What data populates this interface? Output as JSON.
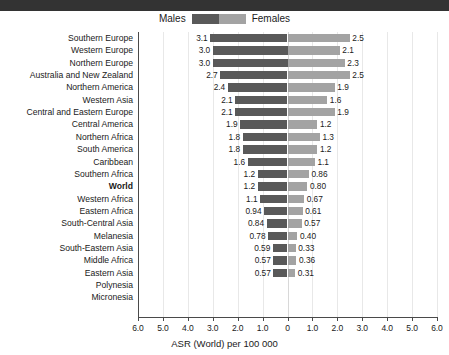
{
  "legend": {
    "males_label": "Males",
    "females_label": "Females",
    "male_color": "#595959",
    "female_color": "#a3a3a3"
  },
  "axis": {
    "title": "ASR (World) per 100 000",
    "ticks": [
      "6.0",
      "5.0",
      "4.0",
      "3.0",
      "2.0",
      "1.0",
      "0",
      "1.0",
      "2.0",
      "3.0",
      "4.0",
      "5.0",
      "6.0"
    ]
  },
  "chart_data": {
    "type": "bar",
    "title": "",
    "subtitle": "",
    "xlabel": "ASR (World) per 100 000",
    "ylabel": "",
    "orientation": "horizontal-diverging",
    "xlim": [
      -6.0,
      6.0
    ],
    "tick_values": [
      -6.0,
      -5.0,
      -4.0,
      -3.0,
      -2.0,
      -1.0,
      0,
      1.0,
      2.0,
      3.0,
      4.0,
      5.0,
      6.0
    ],
    "tick_labels": [
      "6.0",
      "5.0",
      "4.0",
      "3.0",
      "2.0",
      "1.0",
      "0",
      "1.0",
      "2.0",
      "3.0",
      "4.0",
      "5.0",
      "6.0"
    ],
    "grid": true,
    "legend_position": "top-center",
    "legend": [
      "Males",
      "Females"
    ],
    "categories": [
      "Southern Europe",
      "Western Europe",
      "Northern Europe",
      "Australia and New Zealand",
      "Northern America",
      "Western Asia",
      "Central and Eastern Europe",
      "Central America",
      "Northern Africa",
      "South America",
      "Caribbean",
      "Southern Africa",
      "World",
      "Western Africa",
      "Eastern Africa",
      "South-Central Asia",
      "Melanesia",
      "South-Eastern Asia",
      "Middle Africa",
      "Eastern Asia",
      "Polynesia",
      "Micronesia"
    ],
    "series": [
      {
        "name": "Males",
        "values": [
          3.1,
          3.0,
          3.0,
          2.7,
          2.4,
          2.1,
          2.1,
          1.9,
          1.8,
          1.8,
          1.6,
          1.2,
          1.2,
          1.1,
          0.94,
          0.84,
          0.78,
          0.59,
          0.57,
          0.57,
          null,
          null
        ],
        "labels": [
          "3.1",
          "3.0",
          "3.0",
          "2.7",
          "2.4",
          "2.1",
          "2.1",
          "1.9",
          "1.8",
          "1.8",
          "1.6",
          "1.2",
          "1.2",
          "1.1",
          "0.94",
          "0.84",
          "0.78",
          "0.59",
          "0.57",
          "0.57",
          "",
          ""
        ]
      },
      {
        "name": "Females",
        "values": [
          2.5,
          2.1,
          2.3,
          2.5,
          1.9,
          1.6,
          1.9,
          1.2,
          1.3,
          1.2,
          1.1,
          0.86,
          0.8,
          0.67,
          0.61,
          0.57,
          0.4,
          0.33,
          0.36,
          0.31,
          null,
          null
        ],
        "labels": [
          "2.5",
          "2.1",
          "2.3",
          "2.5",
          "1.9",
          "1.6",
          "1.9",
          "1.2",
          "1.3",
          "1.2",
          "1.1",
          "0.86",
          "0.80",
          "0.67",
          "0.61",
          "0.57",
          "0.40",
          "0.33",
          "0.36",
          "0.31",
          "",
          ""
        ]
      }
    ],
    "bold_categories": [
      "World"
    ]
  }
}
